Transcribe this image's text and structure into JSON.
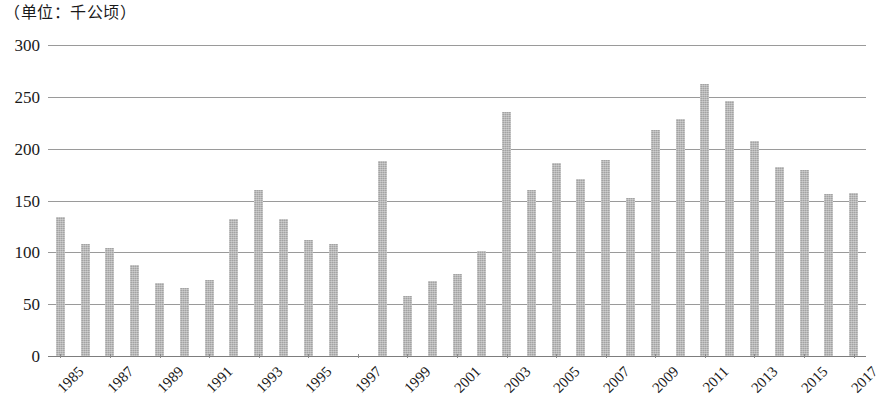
{
  "caption": "（单位：千公顷）",
  "chart_data": {
    "type": "bar",
    "title": "",
    "subtitle": "",
    "caption": "（单位：千公顷）",
    "xlabel": "",
    "ylabel": "",
    "unit": "千公顷",
    "ylim": [
      0,
      300
    ],
    "yticks": [
      0,
      50,
      100,
      150,
      200,
      250,
      300
    ],
    "ytick_labels": [
      "0",
      "50",
      "100",
      "150",
      "200",
      "250",
      "300"
    ],
    "grid": true,
    "legend": false,
    "legend_position": "none",
    "xtick_labels": [
      "1985",
      "1987",
      "1989",
      "1991",
      "1993",
      "1995",
      "1997",
      "1999",
      "2001",
      "2003",
      "2005",
      "2007",
      "2009",
      "2011",
      "2013",
      "2015",
      "2017"
    ],
    "xtick_step": 2,
    "categories": [
      "1985",
      "1986",
      "1987",
      "1988",
      "1989",
      "1990",
      "1991",
      "1992",
      "1993",
      "1994",
      "1995",
      "1996",
      "1997",
      "1998",
      "1999",
      "2000",
      "2001",
      "2002",
      "2003",
      "2004",
      "2005",
      "2006",
      "2007",
      "2008",
      "2009",
      "2010",
      "2011",
      "2012",
      "2013",
      "2014",
      "2015",
      "2016",
      "2017"
    ],
    "values": [
      134,
      108,
      104,
      88,
      70,
      66,
      73,
      132,
      160,
      132,
      112,
      108,
      null,
      188,
      58,
      72,
      79,
      101,
      235,
      160,
      186,
      171,
      189,
      152,
      218,
      229,
      262,
      246,
      207,
      182,
      179,
      156,
      157
    ],
    "bar_color": "#a3a3a3",
    "gridline_color": "#9a9a9a",
    "background": "#ffffff"
  }
}
